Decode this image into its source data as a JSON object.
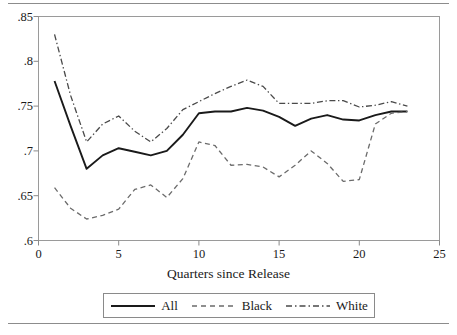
{
  "chart_data": {
    "type": "line",
    "title": "",
    "xlabel": "Quarters since Release",
    "ylabel": "",
    "xlim": [
      0,
      25
    ],
    "ylim": [
      0.6,
      0.85
    ],
    "grid": false,
    "legend_position": "bottom",
    "x_ticks": [
      "0",
      "5",
      "10",
      "15",
      "20",
      "25"
    ],
    "x_tick_values": [
      0,
      5,
      10,
      15,
      20,
      25
    ],
    "y_ticks": [
      ".85",
      ".8",
      ".75",
      ".7",
      ".65",
      ".6"
    ],
    "y_tick_values": [
      0.85,
      0.8,
      0.75,
      0.7,
      0.65,
      0.6
    ],
    "x": [
      1,
      2,
      3,
      4,
      5,
      6,
      7,
      8,
      9,
      10,
      11,
      12,
      13,
      14,
      15,
      16,
      17,
      18,
      19,
      20,
      21,
      22,
      23
    ],
    "series": [
      {
        "name": "All",
        "style": "solid",
        "color": "#1a1a1a",
        "values": [
          0.778,
          0.728,
          0.68,
          0.695,
          0.703,
          0.699,
          0.695,
          0.7,
          0.718,
          0.742,
          0.744,
          0.744,
          0.748,
          0.745,
          0.738,
          0.728,
          0.736,
          0.74,
          0.735,
          0.734,
          0.74,
          0.744,
          0.744
        ]
      },
      {
        "name": "Black",
        "style": "dashed",
        "color": "#6b6b6b",
        "values": [
          0.659,
          0.636,
          0.624,
          0.628,
          0.635,
          0.657,
          0.662,
          0.648,
          0.669,
          0.71,
          0.706,
          0.684,
          0.685,
          0.682,
          0.671,
          0.684,
          0.7,
          0.686,
          0.666,
          0.668,
          0.73,
          0.742,
          0.744
        ]
      },
      {
        "name": "White",
        "style": "dashdot",
        "color": "#4a4a4a",
        "values": [
          0.83,
          0.762,
          0.71,
          0.73,
          0.739,
          0.722,
          0.71,
          0.725,
          0.746,
          0.755,
          0.764,
          0.772,
          0.779,
          0.772,
          0.753,
          0.753,
          0.753,
          0.756,
          0.756,
          0.749,
          0.751,
          0.755,
          0.75
        ]
      }
    ]
  },
  "legend": {
    "entries": [
      {
        "label": "All"
      },
      {
        "label": "Black"
      },
      {
        "label": "White"
      }
    ]
  }
}
